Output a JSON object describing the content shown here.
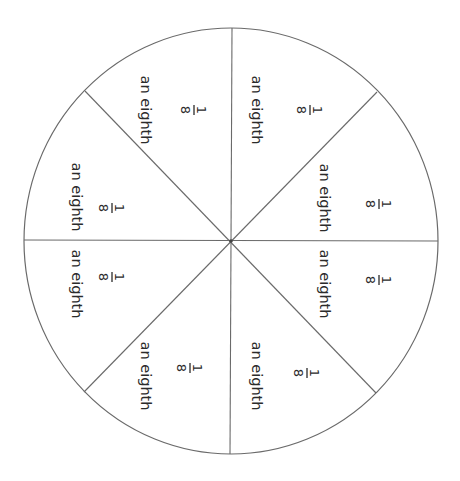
{
  "diagram": {
    "colors": {
      "outline": "#6a6a6a",
      "text": "#2b2b2b",
      "background": "#ffffff"
    },
    "sector_count": 8,
    "sectors": [
      {
        "id": "top-right",
        "word": "an eighth",
        "numerator": "1",
        "denominator": "8"
      },
      {
        "id": "right-upper",
        "word": "an eighth",
        "numerator": "1",
        "denominator": "8"
      },
      {
        "id": "right-lower",
        "word": "an eighth",
        "numerator": "1",
        "denominator": "8"
      },
      {
        "id": "bottom-right",
        "word": "an eighth",
        "numerator": "1",
        "denominator": "8"
      },
      {
        "id": "bottom-left",
        "word": "an eighth",
        "numerator": "1",
        "denominator": "8"
      },
      {
        "id": "left-lower",
        "word": "an eighth",
        "numerator": "1",
        "denominator": "8"
      },
      {
        "id": "left-upper",
        "word": "an eighth",
        "numerator": "1",
        "denominator": "8"
      },
      {
        "id": "top-left",
        "word": "an eighth",
        "numerator": "1",
        "denominator": "8"
      }
    ]
  }
}
